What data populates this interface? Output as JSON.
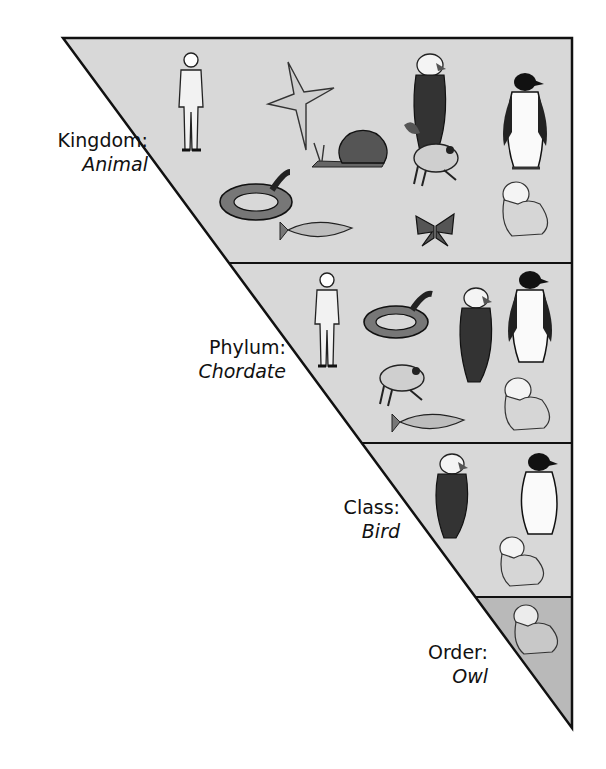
{
  "diagram": {
    "colors": {
      "band_light": "#d8d8d8",
      "band_dark": "#b9b9b9",
      "stroke": "#111111",
      "background": "#ffffff"
    },
    "levels": [
      {
        "rank": "Kingdom:",
        "taxon": "Animal",
        "organisms": [
          "human",
          "starfish",
          "eagle",
          "penguin",
          "snail",
          "frog",
          "snake",
          "fish",
          "butterfly",
          "owl"
        ]
      },
      {
        "rank": "Phylum:",
        "taxon": "Chordate",
        "organisms": [
          "human",
          "snake",
          "eagle",
          "penguin",
          "frog",
          "fish",
          "owl"
        ]
      },
      {
        "rank": "Class:",
        "taxon": "Bird",
        "organisms": [
          "eagle",
          "penguin",
          "owl"
        ]
      },
      {
        "rank": "Order:",
        "taxon": "Owl",
        "organisms": [
          "owl"
        ]
      }
    ]
  }
}
